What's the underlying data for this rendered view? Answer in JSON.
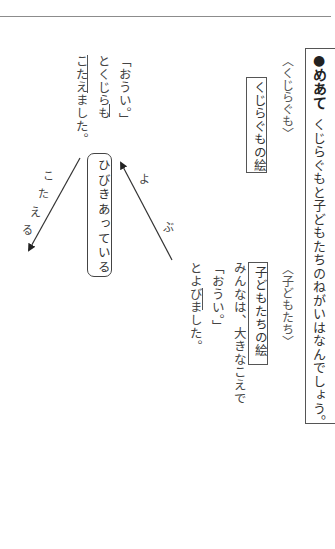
{
  "objective": {
    "icon": "bullet-circle-icon",
    "label": "●めあて",
    "text": "くじらぐもと子どもたちのねがいはなんでしょう。"
  },
  "whale": {
    "heading": "〈くじらぐも〉",
    "picture_label": "くじらぐもの絵",
    "lines": [
      "「おうい。」",
      "とくじらも",
      "こたえました。"
    ]
  },
  "children": {
    "heading": "〈子どもたち〉",
    "picture_label": "子どもたちの絵",
    "lines": [
      "みんなは、大きなこえで",
      "「おうい。」",
      "とよびました。"
    ]
  },
  "center": {
    "label": "ひびきあっている"
  },
  "arrows": {
    "answer": {
      "label_chars": [
        "こ",
        "た",
        "え",
        "る"
      ],
      "label": "こたえる",
      "direction": "down-left"
    },
    "call": {
      "label_chars": [
        "よ",
        "ぶ"
      ],
      "label": "よぶ",
      "direction": "up-left"
    }
  },
  "colors": {
    "rule": "#8c8c8c",
    "border": "#555555",
    "text": "#333333"
  }
}
